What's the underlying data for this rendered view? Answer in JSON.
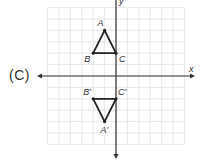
{
  "option_label": "(C)",
  "axes": {
    "x_label": "x",
    "y_label": "y",
    "origin_px": [
      116,
      76
    ],
    "unit_px": 11.4,
    "grid_range": {
      "xmin": -6,
      "xmax": 6,
      "ymin": -6,
      "ymax": 6
    }
  },
  "colors": {
    "grid": "#e2e2e2",
    "axis": "#333333",
    "shape": "#222222",
    "text": "#333333"
  },
  "triangles": [
    {
      "name": "ABC",
      "vertices": [
        {
          "label": "A",
          "x": -1,
          "y": 4
        },
        {
          "label": "B",
          "x": -2,
          "y": 2
        },
        {
          "label": "C",
          "x": 0,
          "y": 2
        }
      ]
    },
    {
      "name": "A'B'C'",
      "vertices": [
        {
          "label": "A'",
          "x": -1,
          "y": -4
        },
        {
          "label": "B'",
          "x": -2,
          "y": -2
        },
        {
          "label": "C'",
          "x": 0,
          "y": -2
        }
      ]
    }
  ]
}
